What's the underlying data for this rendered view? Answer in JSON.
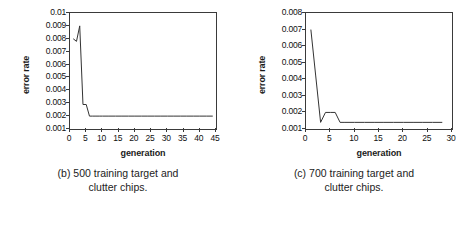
{
  "figure": {
    "panels": [
      {
        "id": "panel-b",
        "caption_line1": "(b) 500 training target and",
        "caption_line2": "clutter chips.",
        "chart_data": {
          "type": "line",
          "title": "",
          "xlabel": "generation",
          "ylabel": "error rate",
          "xlim": [
            0,
            45
          ],
          "ylim": [
            0.001,
            0.01
          ],
          "xticks": [
            "0",
            "5",
            "10",
            "15",
            "20",
            "25",
            "30",
            "35",
            "40",
            "45"
          ],
          "xtick_values": [
            0,
            5,
            10,
            15,
            20,
            25,
            30,
            35,
            40,
            45
          ],
          "yticks": [
            "0.01",
            "0.009",
            "0.008",
            "0.007",
            "0.006",
            "0.005",
            "0.004",
            "0.003",
            "0.002",
            "0.001"
          ],
          "ytick_values": [
            0.01,
            0.009,
            0.008,
            0.007,
            0.006,
            0.005,
            0.004,
            0.003,
            0.002,
            0.001
          ],
          "grid": false,
          "legend": "none",
          "series": [
            {
              "name": "error rate",
              "x": [
                1,
                2,
                3,
                4,
                5,
                6,
                7,
                8,
                9,
                10,
                12,
                14,
                16,
                18,
                20,
                22,
                24,
                26,
                28,
                30,
                32,
                34,
                36,
                38,
                40,
                42,
                44
              ],
              "values": [
                0.008,
                0.0078,
                0.009,
                0.0029,
                0.0029,
                0.002,
                0.002,
                0.002,
                0.002,
                0.002,
                0.002,
                0.002,
                0.002,
                0.002,
                0.002,
                0.002,
                0.002,
                0.002,
                0.002,
                0.002,
                0.002,
                0.002,
                0.002,
                0.002,
                0.002,
                0.002,
                0.002
              ]
            }
          ]
        }
      },
      {
        "id": "panel-c",
        "caption_line1": "(c) 700 training target and",
        "caption_line2": "clutter chips.",
        "chart_data": {
          "type": "line",
          "title": "",
          "xlabel": "generation",
          "ylabel": "error rate",
          "xlim": [
            0,
            30
          ],
          "ylim": [
            0.001,
            0.008
          ],
          "xticks": [
            "0",
            "5",
            "10",
            "15",
            "20",
            "25",
            "30"
          ],
          "xtick_values": [
            0,
            5,
            10,
            15,
            20,
            25,
            30
          ],
          "yticks": [
            "0.008",
            "0.007",
            "0.006",
            "0.005",
            "0.004",
            "0.003",
            "0.002",
            "0.001"
          ],
          "ytick_values": [
            0.008,
            0.007,
            0.006,
            0.005,
            0.004,
            0.003,
            0.002,
            0.001
          ],
          "grid": false,
          "legend": "none",
          "series": [
            {
              "name": "error rate",
              "x": [
                1,
                2,
                3,
                4,
                5,
                6,
                7,
                8,
                10,
                12,
                14,
                16,
                18,
                20,
                22,
                24,
                26,
                28
              ],
              "values": [
                0.007,
                0.0042,
                0.0014,
                0.002,
                0.002,
                0.002,
                0.0014,
                0.0014,
                0.0014,
                0.0014,
                0.0014,
                0.0014,
                0.0014,
                0.0014,
                0.0014,
                0.0014,
                0.0014,
                0.0014
              ]
            }
          ]
        }
      }
    ]
  },
  "colors": {
    "line": "#333333",
    "frame": "#3a3a3a",
    "text": "#111111",
    "background": "#ffffff"
  }
}
